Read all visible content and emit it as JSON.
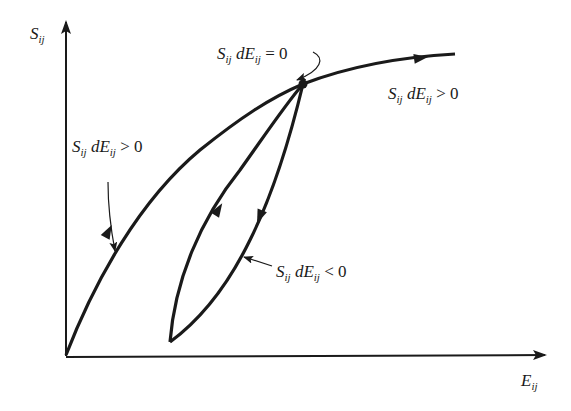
{
  "diagram": {
    "axes": {
      "y_label": {
        "main": "S",
        "sub": "ij"
      },
      "x_label": {
        "main": "E",
        "sub": "ij"
      }
    },
    "annotations": [
      {
        "id": "zero",
        "text_S": "S",
        "sub1": "ij",
        "d": "dE",
        "sub2": "ij",
        "relation": "= 0"
      },
      {
        "id": "pos_right",
        "text_S": "S",
        "sub1": "ij",
        "d": "dE",
        "sub2": "ij",
        "relation": "> 0"
      },
      {
        "id": "pos_left",
        "text_S": "S",
        "sub1": "ij",
        "d": "dE",
        "sub2": "ij",
        "relation": "> 0"
      },
      {
        "id": "neg",
        "text_S": "S",
        "sub1": "ij",
        "d": "dE",
        "sub2": "ij",
        "relation": "< 0"
      }
    ],
    "colors": {
      "ink": "#1a1a1a",
      "background": "#ffffff"
    }
  }
}
